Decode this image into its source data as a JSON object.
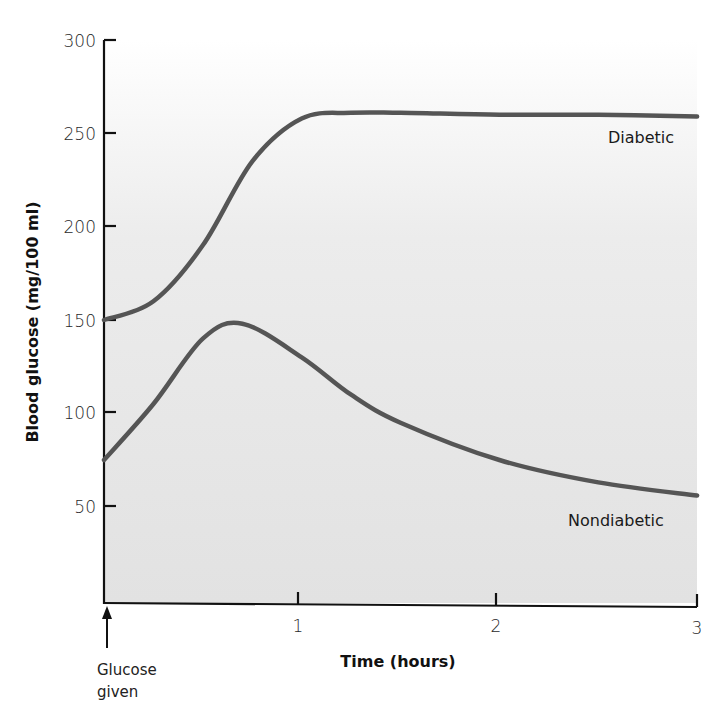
{
  "chart_data": {
    "type": "line",
    "title": "",
    "xlabel": "Time (hours)",
    "ylabel": "Blood glucose (mg/100 ml)",
    "xlim": [
      0,
      3
    ],
    "ylim": [
      0,
      300
    ],
    "x_ticks": [
      0,
      1,
      2,
      3
    ],
    "x_tick_labels": [
      "",
      "1",
      "2",
      "3"
    ],
    "y_ticks": [
      50,
      100,
      150,
      200,
      250,
      300
    ],
    "y_tick_labels": [
      "50",
      "100",
      "150",
      "200",
      "250",
      "300"
    ],
    "grid": false,
    "legend": "inline labels",
    "series": [
      {
        "name": "Diabetic",
        "x": [
          0,
          0.25,
          0.5,
          0.75,
          1.0,
          1.25,
          1.5,
          2.0,
          2.5,
          3.0
        ],
        "values": [
          150,
          160,
          190,
          235,
          258,
          261,
          261,
          260,
          260,
          259
        ],
        "color": "#555555"
      },
      {
        "name": "Nondiabetic",
        "x": [
          0,
          0.25,
          0.5,
          0.7,
          1.0,
          1.25,
          1.5,
          2.0,
          2.5,
          3.0
        ],
        "values": [
          75,
          105,
          140,
          148,
          130,
          110,
          95,
          75,
          63,
          56
        ],
        "color": "#555555"
      }
    ],
    "annotations": [
      {
        "text_lines": [
          "Glucose",
          "given"
        ],
        "x": 0,
        "type": "arrow-up",
        "note": "arrow at t=0 below x-axis"
      }
    ]
  },
  "labels": {
    "y_axis_title": "Blood glucose (mg/100 ml)",
    "x_axis_title": "Time (hours)",
    "series_diabetic": "Diabetic",
    "series_nondiabetic": "Nondiabetic",
    "annotation_line1": "Glucose",
    "annotation_line2": "given",
    "y_ticks": [
      "50",
      "100",
      "150",
      "200",
      "250",
      "300"
    ],
    "x_ticks": [
      "1",
      "2",
      "3"
    ]
  },
  "colors": {
    "plot_background": "#e4e4e4",
    "curve": "#555555",
    "axis": "#111111"
  }
}
